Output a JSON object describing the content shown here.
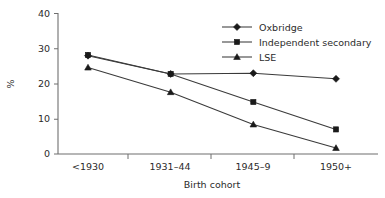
{
  "chart_data": {
    "type": "line",
    "title": "",
    "xlabel": "Birth cohort",
    "ylabel": "%",
    "categories": [
      "<1930",
      "1931–44",
      "1945–9",
      "1950+"
    ],
    "yticks": [
      0,
      10,
      20,
      30,
      40
    ],
    "ylim": [
      0,
      40
    ],
    "grid": false,
    "legend_position": "top-right",
    "series": [
      {
        "name": "Oxbridge",
        "marker": "diamond",
        "values": [
          28.0,
          22.8,
          23.0,
          21.4
        ]
      },
      {
        "name": "Independent secondary",
        "marker": "square",
        "values": [
          28.2,
          22.8,
          14.8,
          7.0
        ]
      },
      {
        "name": "LSE",
        "marker": "triangle",
        "values": [
          24.6,
          17.6,
          8.4,
          1.7
        ]
      }
    ]
  },
  "axes": {
    "y_label": "%",
    "x_label": "Birth cohort",
    "y_tick_labels": [
      "0",
      "10",
      "20",
      "30",
      "40"
    ],
    "x_tick_labels": [
      "<1930",
      "1931–44",
      "1945–9",
      "1950+"
    ]
  },
  "legend": {
    "entries": [
      {
        "label": "Oxbridge",
        "marker": "diamond"
      },
      {
        "label": "Independent secondary",
        "marker": "square"
      },
      {
        "label": "LSE",
        "marker": "triangle"
      }
    ]
  },
  "colors": {
    "line": "#3a3a3a",
    "marker": "#1a1a1a",
    "axis": "#6f6f6f",
    "text": "#2b2b2b",
    "background": "#ffffff"
  }
}
